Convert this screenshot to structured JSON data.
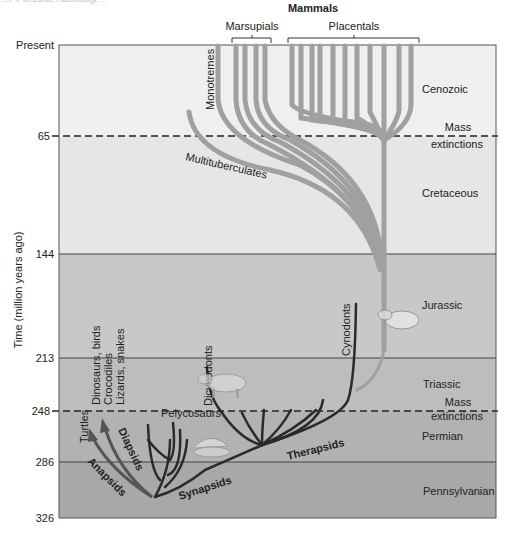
{
  "caption_fragment": "…n, © Vertebrate Paleontology, ...",
  "header": {
    "title": "Mammals",
    "groups": [
      {
        "label": "Marsupials"
      },
      {
        "label": "Placentals"
      }
    ]
  },
  "axis": {
    "ylabel": "Time (million years ago)",
    "ticks": [
      {
        "label": "Present",
        "value": 0
      },
      {
        "label": "65",
        "value": 65
      },
      {
        "label": "144",
        "value": 144
      },
      {
        "label": "213",
        "value": 213
      },
      {
        "label": "248",
        "value": 248
      },
      {
        "label": "286",
        "value": 286
      },
      {
        "label": "326",
        "value": 326
      }
    ]
  },
  "periods": [
    {
      "name": "Cenozoic",
      "start": 0,
      "end": 65,
      "color": "#efefef"
    },
    {
      "name": "Cretaceous",
      "start": 65,
      "end": 144,
      "color": "#e6e6e6"
    },
    {
      "name": "Jurassic",
      "start": 144,
      "end": 213,
      "color": "#c8c8c8"
    },
    {
      "name": "Triassic",
      "start": 213,
      "end": 248,
      "color": "#bdbdbd"
    },
    {
      "name": "Permian",
      "start": 248,
      "end": 286,
      "color": "#b2b2b2"
    },
    {
      "name": "Pennsylvanian",
      "start": 286,
      "end": 326,
      "color": "#a8a8a8"
    }
  ],
  "events": [
    {
      "label_line1": "Mass",
      "label_line2": "extinctions",
      "time": 65
    },
    {
      "label_line1": "Mass",
      "label_line2": "extinctions",
      "time": 248
    }
  ],
  "lineages": {
    "mammal_groups": [
      "Monotremes",
      "Multituberculates"
    ],
    "synapsid_groups": [
      "Pelycosaurs",
      "Dicynodonts",
      "Cynodonts",
      "Therapsids",
      "Synapsids"
    ],
    "reptile_groups": [
      "Turtles",
      "Dinosaurs, birds",
      "Crocodiles",
      "Lizards, snakes",
      "Anapsids",
      "Diapsids"
    ]
  },
  "colors": {
    "mammal_branch": "#a0a0a0",
    "synapsid_branch": "#2a2a2a",
    "reptile_arrow": "#555555",
    "frame": "#555555"
  }
}
